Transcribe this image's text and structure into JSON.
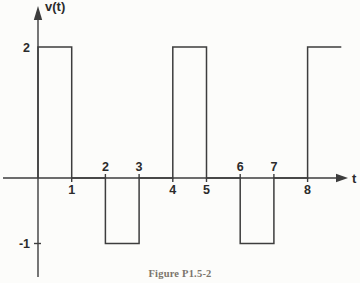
{
  "figure": {
    "caption": "Figure P1.5-2"
  },
  "chart_data": {
    "type": "line",
    "subtype": "square-wave-pulse-train",
    "title": "",
    "xlabel": "t",
    "ylabel": "v(t)",
    "xlim": [
      -1,
      9.3
    ],
    "ylim": [
      -1.55,
      2.6
    ],
    "grid": false,
    "legend": "none",
    "series": [
      {
        "name": "v(t)",
        "points": [
          [
            0,
            0
          ],
          [
            0,
            2
          ],
          [
            1,
            2
          ],
          [
            1,
            0
          ],
          [
            2,
            0
          ],
          [
            2,
            -1
          ],
          [
            3,
            -1
          ],
          [
            3,
            0
          ],
          [
            4,
            0
          ],
          [
            4,
            2
          ],
          [
            5,
            2
          ],
          [
            5,
            0
          ],
          [
            6,
            0
          ],
          [
            6,
            -1
          ],
          [
            7,
            -1
          ],
          [
            7,
            0
          ],
          [
            8,
            0
          ],
          [
            8,
            2
          ],
          [
            9,
            2
          ]
        ]
      }
    ],
    "x_ticks": [
      {
        "t": 1,
        "label": "1",
        "label_side": "below"
      },
      {
        "t": 2,
        "label": "2",
        "label_side": "above"
      },
      {
        "t": 3,
        "label": "3",
        "label_side": "above"
      },
      {
        "t": 4,
        "label": "4",
        "label_side": "below"
      },
      {
        "t": 5,
        "label": "5",
        "label_side": "below"
      },
      {
        "t": 6,
        "label": "6",
        "label_side": "above"
      },
      {
        "t": 7,
        "label": "7",
        "label_side": "above"
      },
      {
        "t": 8,
        "label": "8",
        "label_side": "below"
      }
    ],
    "y_ticks": [
      {
        "v": 2,
        "label": "2",
        "tick_mark": false
      },
      {
        "v": -1,
        "label": "-1",
        "tick_mark": true
      }
    ],
    "colors": {
      "line": "#3d3d3d",
      "text": "#2b2b2b",
      "caption": "#5f574c",
      "background": "#fcfcfa"
    }
  }
}
